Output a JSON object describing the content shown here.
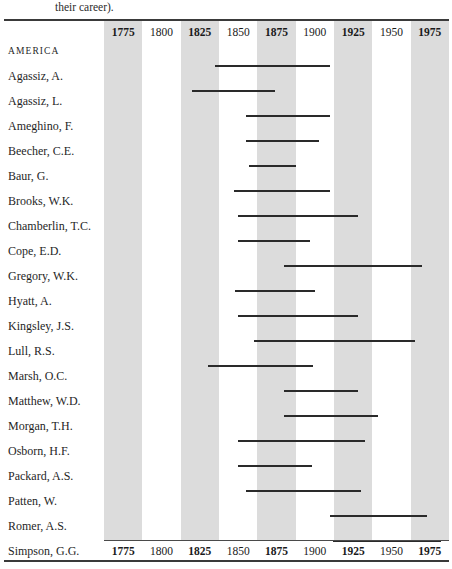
{
  "caption": "their career).",
  "axis": {
    "ticks": [
      1775,
      1800,
      1825,
      1850,
      1875,
      1900,
      1925,
      1950,
      1975
    ],
    "tick_labels": [
      "1775",
      "1800",
      "1825",
      "1850",
      "1875",
      "1900",
      "1925",
      "1950",
      "1975"
    ],
    "band_start_year": 1762.5,
    "band_end_year": 1987.5,
    "band_width_years": 25,
    "shaded_ticks": [
      "1775",
      "1825",
      "1875",
      "1925",
      "1975"
    ]
  },
  "colors": {
    "band_shaded": "#dcdcdc",
    "band_plain": "#ffffff",
    "bar": "#2a2a2a",
    "rule": "#3a3a3a",
    "text": "#1f1f1f"
  },
  "section_label": "AMERICA",
  "chart_data": {
    "type": "bar",
    "title": "",
    "subtitle": "",
    "xlabel": "",
    "ylabel": "",
    "orientation": "horizontal-range",
    "xlim": [
      1762.5,
      1987.5
    ],
    "grid": "vertical alternating shaded bands every 25 years",
    "legend": "none",
    "categories": [
      "Agassiz, A.",
      "Agassiz, L.",
      "Ameghino, F.",
      "Beecher, C.E.",
      "Baur, G.",
      "Brooks, W.K.",
      "Chamberlin, T.C.",
      "Cope, E.D.",
      "Gregory, W.K.",
      "Hyatt, A.",
      "Kingsley, J.S.",
      "Lull, R.S.",
      "Marsh, O.C.",
      "Matthew, W.D.",
      "Morgan, T.H.",
      "Osborn, H.F.",
      "Packard, A.S.",
      "Patten, W.",
      "Romer, A.S.",
      "Simpson, G.G."
    ],
    "ranges": [
      {
        "name": "Agassiz, A.",
        "start": 1835,
        "end": 1910
      },
      {
        "name": "Agassiz, L.",
        "start": 1820,
        "end": 1874
      },
      {
        "name": "Ameghino, F.",
        "start": 1855,
        "end": 1910
      },
      {
        "name": "Beecher, C.E.",
        "start": 1855,
        "end": 1903
      },
      {
        "name": "Baur, G.",
        "start": 1857,
        "end": 1888
      },
      {
        "name": "Brooks, W.K.",
        "start": 1847,
        "end": 1910
      },
      {
        "name": "Chamberlin, T.C.",
        "start": 1850,
        "end": 1928
      },
      {
        "name": "Cope, E.D.",
        "start": 1850,
        "end": 1897
      },
      {
        "name": "Gregory, W.K.",
        "start": 1880,
        "end": 1970
      },
      {
        "name": "Hyatt, A.",
        "start": 1848,
        "end": 1900
      },
      {
        "name": "Kingsley, J.S.",
        "start": 1850,
        "end": 1928
      },
      {
        "name": "Lull, R.S.",
        "start": 1860,
        "end": 1965
      },
      {
        "name": "Marsh, O.C.",
        "start": 1830,
        "end": 1899
      },
      {
        "name": "Matthew, W.D.",
        "start": 1880,
        "end": 1928
      },
      {
        "name": "Morgan, T.H.",
        "start": 1880,
        "end": 1941
      },
      {
        "name": "Osborn, H.F.",
        "start": 1850,
        "end": 1933
      },
      {
        "name": "Packard, A.S.",
        "start": 1850,
        "end": 1898
      },
      {
        "name": "Patten, W.",
        "start": 1855,
        "end": 1930
      },
      {
        "name": "Romer, A.S.",
        "start": 1910,
        "end": 1973
      },
      {
        "name": "Simpson, G.G.",
        "start": 1912,
        "end": 1982
      }
    ]
  }
}
